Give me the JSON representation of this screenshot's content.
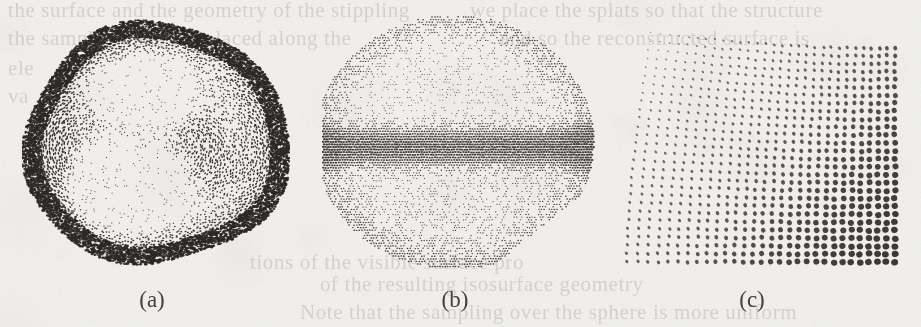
{
  "figure": {
    "kind": "scanned-paper-figure",
    "width": 921,
    "height": 327,
    "background_color": "#efeeec",
    "ink_color": "#2b2926",
    "panel_count": 3
  },
  "captions": [
    {
      "label": "(a)",
      "cx": 152,
      "y": 288
    },
    {
      "label": "(b)",
      "cx": 455,
      "y": 288
    },
    {
      "label": "(c)",
      "cx": 752,
      "y": 288
    }
  ],
  "panels": [
    {
      "id": "panel-a",
      "caption": "(a)",
      "name": "stippled-sphere-two-lobes",
      "x": 22,
      "y": 18,
      "w": 268,
      "h": 252,
      "description": "Dense stipple rendering of a rounded blob with a dark rim and two bright lobed highlight regions; stipple dot orientation follows curvature flow lines.",
      "rim_darkness": 0.93,
      "dot_spacing": 3.0,
      "dot_size_min": 0.55,
      "dot_size_max": 1.55,
      "highlights": [
        {
          "cx": 0.46,
          "cy": 0.28,
          "rx": 0.26,
          "ry": 0.2,
          "strength": 0.92
        },
        {
          "cx": 0.4,
          "cy": 0.68,
          "rx": 0.3,
          "ry": 0.24,
          "strength": 1.0
        }
      ],
      "shadow_cores": [
        {
          "cx": 0.7,
          "cy": 0.52,
          "rx": 0.2,
          "ry": 0.26,
          "strength": 0.8
        },
        {
          "cx": 0.13,
          "cy": 0.45,
          "rx": 0.14,
          "ry": 0.3,
          "strength": 0.7
        }
      ]
    },
    {
      "id": "panel-b",
      "caption": "(b)",
      "name": "stippled-sphere-equator-band",
      "x": 322,
      "y": 16,
      "w": 276,
      "h": 252,
      "description": "Regular-grid halftone sphere with a dark horizontal band across the equator, lighter toward top and bottom, with an angular notch cut from the lower-right silhouette.",
      "band_center": 0.52,
      "band_width": 0.11,
      "dot_spacing": 2.6,
      "dot_size_min": 0.45,
      "dot_size_max": 1.35,
      "notch": {
        "x": 0.72,
        "y": 0.74
      }
    },
    {
      "id": "panel-c",
      "caption": "(c)",
      "name": "anisotropic-dot-field",
      "x": 618,
      "y": 26,
      "w": 284,
      "h": 244,
      "description": "Quadrilateral field of ellipse marks. Marks are thin, steeply slanted strokes at the upper-left and grow progressively into large round dots toward the lower-right; spacing widens toward the right.",
      "cols": 30,
      "rows": 28,
      "mark_aspect_min": 0.12,
      "mark_aspect_max": 1.0,
      "mark_size_min": 1.4,
      "mark_size_max": 5.2,
      "mark_angle_deg_min": -62,
      "mark_angle_deg_max": -8
    }
  ],
  "bleed_through_lines": [
    {
      "text": "the surface and the geometry of the stippling",
      "x": 8,
      "y": -2
    },
    {
      "text": "we place the splats so that the structure",
      "x": 470,
      "y": -2
    },
    {
      "text": "the sample points are placed along the",
      "x": 8,
      "y": 26
    },
    {
      "text": "and so the reconstructed surface is",
      "x": 500,
      "y": 26
    },
    {
      "text": "ele",
      "x": 8,
      "y": 56
    },
    {
      "text": "va",
      "x": 8,
      "y": 84
    },
    {
      "text": "tions of the visible surface pro",
      "x": 250,
      "y": 250
    },
    {
      "text": "of the resulting isosurface geometry",
      "x": 320,
      "y": 272
    },
    {
      "text": "Note that the sampling over the sphere is more uniform",
      "x": 300,
      "y": 300
    }
  ]
}
